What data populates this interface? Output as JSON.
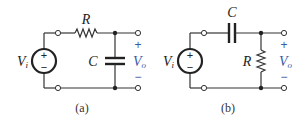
{
  "figure": {
    "circuits": [
      {
        "id": "a",
        "caption": "(a)",
        "type": "RC low-pass",
        "source_label": "V",
        "source_sub": "i",
        "series_label": "R",
        "shunt_label": "C",
        "output_label": "V",
        "output_sub": "o",
        "plus": "+",
        "minus": "−",
        "source_plus": "+",
        "source_minus": "−"
      },
      {
        "id": "b",
        "caption": "(b)",
        "type": "RC high-pass",
        "source_label": "V",
        "source_sub": "i",
        "series_label": "C",
        "shunt_label": "R",
        "output_label": "V",
        "output_sub": "o",
        "plus": "+",
        "minus": "−",
        "source_plus": "+",
        "source_minus": "−"
      }
    ],
    "colors": {
      "wire": "#333333",
      "output_label": "#3a5ba8"
    }
  }
}
